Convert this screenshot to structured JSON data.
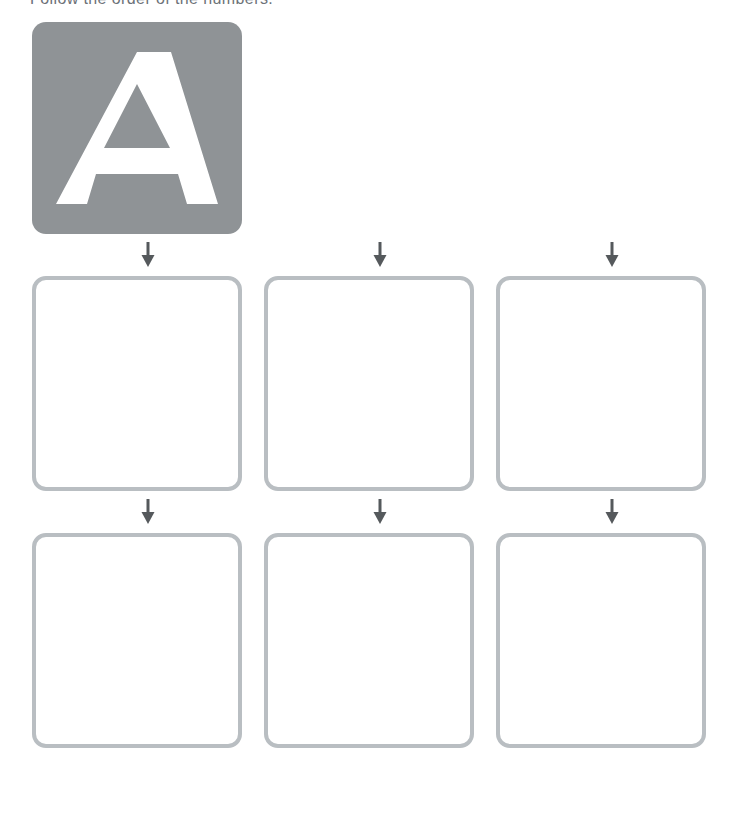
{
  "instruction": "Follow the order of the numbers.",
  "colors": {
    "tile_a": "#8f9396",
    "tile_b": "#c9cccd",
    "tile_c": "#bfc2c3",
    "tile_border": "#b9bec2",
    "letter_fill_white": "#ffffff",
    "letter_fill_ghost_a": "#e2e5e4",
    "letter_fill_ghost_bc": "#f3f4f4",
    "guide_dash": "#b0b4b7",
    "stroke_mark": "#6a6f73",
    "alphabet_text": "#3f4448",
    "alphabet_border": "#c9cdd0"
  },
  "rows": [
    {
      "name": "row-filled",
      "style": "solid-background",
      "tiles": [
        {
          "letter": "A",
          "bg": "#8f9396",
          "letter_color": "#ffffff",
          "strokes": [
            "1",
            "2",
            "3"
          ],
          "stars": 3
        },
        {
          "letter": "B",
          "bg": "#c9cccd",
          "letter_color": "#ffffff",
          "strokes": [
            "1",
            "2"
          ],
          "stars": 1
        },
        {
          "letter": "C",
          "bg": "#bfc2c3",
          "letter_color": "#ffffff",
          "strokes": [],
          "stars": 1
        }
      ]
    },
    {
      "name": "row-ghost",
      "style": "outlined-light-letter",
      "tiles": [
        {
          "letter": "A",
          "bg": "#ffffff",
          "letter_color": "#e2e5e4",
          "strokes": [
            "1",
            "2",
            "3"
          ],
          "stars": 3
        },
        {
          "letter": "B",
          "bg": "#ffffff",
          "letter_color": "#f3f4f4",
          "strokes": [
            "1",
            "2"
          ],
          "stars": 1
        },
        {
          "letter": "C",
          "bg": "#ffffff",
          "letter_color": "#f3f4f4",
          "strokes": [],
          "stars": 1
        }
      ]
    },
    {
      "name": "row-trace",
      "style": "outlined-dashed-only",
      "tiles": [
        {
          "letter": "A",
          "bg": "#ffffff",
          "letter_color": "none",
          "strokes": [
            "1",
            "2",
            "3"
          ],
          "stars": 3
        },
        {
          "letter": "B",
          "bg": "#ffffff",
          "letter_color": "none",
          "strokes": [
            "1",
            "2"
          ],
          "stars": 1
        },
        {
          "letter": "C",
          "bg": "#ffffff",
          "letter_color": "none",
          "strokes": [],
          "stars": 1
        }
      ]
    }
  ],
  "connectors": {
    "icon": "down-arrow-icon",
    "count_per_gap": 3,
    "gaps": 2
  },
  "alphabet": {
    "letters": [
      "A",
      "B",
      "C",
      "D",
      "E",
      "F",
      "G",
      "H",
      "I",
      "J",
      "K",
      "L",
      "M",
      "N",
      "O",
      "P",
      "Q",
      "R",
      "S",
      "T",
      "U",
      "V",
      "W",
      "X",
      "Y",
      "Z"
    ],
    "highlighted": [
      {
        "letter": "A",
        "bg": "#8f9396"
      },
      {
        "letter": "B",
        "bg": "#c9cccd"
      },
      {
        "letter": "C",
        "bg": "#dfe1e2"
      }
    ]
  }
}
